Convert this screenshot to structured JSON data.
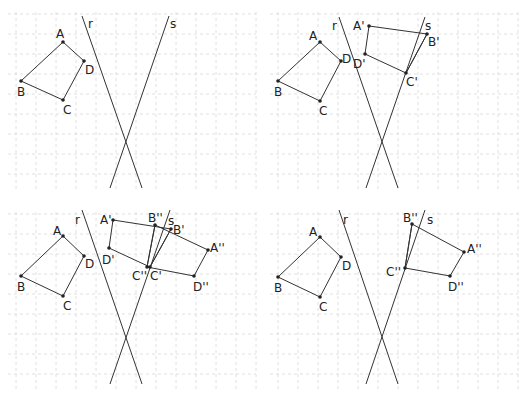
{
  "figure": {
    "grid_spacing_px": 20
  },
  "panels": [
    {
      "id": "panel-1",
      "origin": [
        0,
        0
      ],
      "lines": [
        {
          "label": "r",
          "from": [
            82,
            16
          ],
          "to": [
            142,
            188
          ],
          "label_pos": [
            88,
            28
          ]
        },
        {
          "label": "s",
          "from": [
            169,
            16
          ],
          "to": [
            110,
            188
          ],
          "label_pos": [
            170,
            28
          ]
        }
      ],
      "polygons": [
        {
          "name": "ABCD",
          "points": [
            "A",
            "D",
            "C",
            "B"
          ]
        }
      ],
      "points": {
        "A": {
          "xy": [
            63,
            42
          ],
          "label": "A",
          "label_pos": [
            56,
            38
          ]
        },
        "B": {
          "xy": [
            21,
            81
          ],
          "label": "B",
          "label_pos": [
            17,
            96
          ]
        },
        "C": {
          "xy": [
            63,
            100
          ],
          "label": "C",
          "label_pos": [
            63,
            114
          ]
        },
        "D": {
          "xy": [
            84,
            61
          ],
          "label": "D",
          "label_pos": [
            85,
            74
          ]
        }
      },
      "extra_segments": []
    },
    {
      "id": "panel-2",
      "origin": [
        262,
        0
      ],
      "lines": [
        {
          "label": "r",
          "from": [
            77,
            17
          ],
          "to": [
            136,
            188
          ],
          "label_pos": [
            70,
            30
          ]
        },
        {
          "label": "s",
          "from": [
            163,
            17
          ],
          "to": [
            104,
            188
          ],
          "label_pos": [
            163,
            30
          ]
        }
      ],
      "polygons": [
        {
          "name": "ABCD",
          "points": [
            "A",
            "D",
            "C",
            "B"
          ]
        },
        {
          "name": "A'B'C'D'",
          "points": [
            "A'",
            "B'",
            "C'",
            "D'"
          ]
        }
      ],
      "points": {
        "A": {
          "xy": [
            58,
            42
          ],
          "label": "A",
          "label_pos": [
            47,
            40
          ]
        },
        "B": {
          "xy": [
            16,
            81
          ],
          "label": "B",
          "label_pos": [
            12,
            96
          ]
        },
        "C": {
          "xy": [
            58,
            101
          ],
          "label": "C",
          "label_pos": [
            57,
            115
          ]
        },
        "D": {
          "xy": [
            79,
            61
          ],
          "label": "D",
          "label_pos": [
            80,
            63
          ]
        },
        "A'": {
          "xy": [
            107,
            26
          ],
          "label": "A'",
          "label_pos": [
            91,
            30
          ]
        },
        "B'": {
          "xy": [
            165,
            34
          ],
          "label": "B'",
          "label_pos": [
            166,
            46
          ]
        },
        "C'": {
          "xy": [
            144,
            73
          ],
          "label": "C'",
          "label_pos": [
            144,
            86
          ]
        },
        "D'": {
          "xy": [
            103,
            54
          ],
          "label": "D'",
          "label_pos": [
            91,
            68
          ]
        }
      },
      "extra_segments": [
        {
          "from": "C'",
          "to": "B'"
        }
      ]
    },
    {
      "id": "panel-3",
      "origin": [
        0,
        200
      ],
      "lines": [
        {
          "label": "r",
          "from": [
            82,
            10
          ],
          "to": [
            142,
            184
          ],
          "label_pos": [
            75,
            24
          ]
        },
        {
          "label": "s",
          "from": [
            170,
            10
          ],
          "to": [
            110,
            184
          ],
          "label_pos": [
            168,
            25
          ]
        }
      ],
      "polygons": [
        {
          "name": "ABCD",
          "points": [
            "A",
            "D",
            "C",
            "B"
          ]
        },
        {
          "name": "A'B'C'D'",
          "points": [
            "A'",
            "B'",
            "C'",
            "D'"
          ]
        },
        {
          "name": "A''B''C''D''",
          "points": [
            "B''",
            "A''",
            "D''",
            "C''"
          ]
        }
      ],
      "points": {
        "A": {
          "xy": [
            63,
            36
          ],
          "label": "A",
          "label_pos": [
            53,
            35
          ]
        },
        "B": {
          "xy": [
            21,
            76
          ],
          "label": "B",
          "label_pos": [
            17,
            91
          ]
        },
        "C": {
          "xy": [
            63,
            96
          ],
          "label": "C",
          "label_pos": [
            63,
            110
          ]
        },
        "D": {
          "xy": [
            84,
            56
          ],
          "label": "D",
          "label_pos": [
            85,
            68
          ]
        },
        "A'": {
          "xy": [
            113,
            20
          ],
          "label": "A'",
          "label_pos": [
            100,
            24
          ]
        },
        "B''": {
          "xy": [
            155,
            25
          ],
          "label": "B''",
          "label_pos": [
            148,
            22
          ]
        },
        "B'": {
          "xy": [
            171,
            29
          ],
          "label": "B'",
          "label_pos": [
            173,
            34
          ]
        },
        "A''": {
          "xy": [
            208,
            50
          ],
          "label": "A''",
          "label_pos": [
            210,
            52
          ]
        },
        "D''": {
          "xy": [
            194,
            76
          ],
          "label": "D''",
          "label_pos": [
            193,
            91
          ]
        },
        "C'": {
          "xy": [
            150,
            67
          ],
          "label": "C'",
          "label_pos": [
            150,
            80
          ]
        },
        "C''": {
          "xy": [
            147,
            67
          ],
          "label": "C''",
          "label_pos": [
            132,
            80
          ]
        },
        "D'": {
          "xy": [
            109,
            48
          ],
          "label": "D'",
          "label_pos": [
            102,
            64
          ]
        }
      },
      "extra_segments": [
        {
          "from": "C'",
          "to": "B'"
        },
        {
          "from": "C''",
          "to": "B''"
        }
      ]
    },
    {
      "id": "panel-4",
      "origin": [
        262,
        200
      ],
      "lines": [
        {
          "label": "r",
          "from": [
            77,
            10
          ],
          "to": [
            136,
            184
          ],
          "label_pos": [
            81,
            24
          ]
        },
        {
          "label": "s",
          "from": [
            163,
            10
          ],
          "to": [
            104,
            184
          ],
          "label_pos": [
            165,
            24
          ]
        }
      ],
      "polygons": [
        {
          "name": "ABCD",
          "points": [
            "A",
            "D",
            "C",
            "B"
          ]
        },
        {
          "name": "A''B''C''D''",
          "points": [
            "B''",
            "A''",
            "D''",
            "C''"
          ]
        }
      ],
      "points": {
        "A": {
          "xy": [
            58,
            37
          ],
          "label": "A",
          "label_pos": [
            47,
            36
          ]
        },
        "B": {
          "xy": [
            16,
            77
          ],
          "label": "B",
          "label_pos": [
            12,
            92
          ]
        },
        "C": {
          "xy": [
            58,
            97
          ],
          "label": "C",
          "label_pos": [
            57,
            111
          ]
        },
        "D": {
          "xy": [
            79,
            57
          ],
          "label": "D",
          "label_pos": [
            80,
            70
          ]
        },
        "B''": {
          "xy": [
            150,
            24
          ],
          "label": "B''",
          "label_pos": [
            141,
            22
          ]
        },
        "A''": {
          "xy": [
            202,
            52
          ],
          "label": "A''",
          "label_pos": [
            205,
            53
          ]
        },
        "D''": {
          "xy": [
            188,
            76
          ],
          "label": "D''",
          "label_pos": [
            186,
            91
          ]
        },
        "C''": {
          "xy": [
            143,
            68
          ],
          "label": "C''",
          "label_pos": [
            124,
            76
          ]
        }
      },
      "extra_segments": [
        {
          "from": "C''",
          "to": "B''"
        }
      ]
    }
  ],
  "colors": {
    "line": "#333333",
    "grid": "#d8d8d8",
    "text": "#222222",
    "background": "#ffffff"
  }
}
